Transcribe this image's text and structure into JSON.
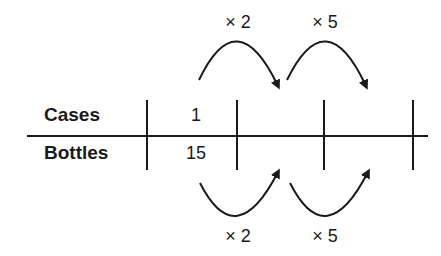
{
  "diagram": {
    "type": "ratio-table",
    "rows": [
      {
        "label": "Cases",
        "values": [
          "1",
          "",
          "",
          ""
        ]
      },
      {
        "label": "Bottles",
        "values": [
          "15",
          "",
          "",
          ""
        ]
      }
    ],
    "top_operations": [
      "× 2",
      "× 5"
    ],
    "bottom_operations": [
      "× 2",
      "× 5"
    ],
    "line_color": "#1a1a1a"
  }
}
